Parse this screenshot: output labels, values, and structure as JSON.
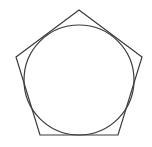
{
  "diagram": {
    "stroke_color": "#3a3a3a",
    "background": "#ffffff",
    "pentagon": {
      "points": [
        [
          79,
          10
        ],
        [
          142,
          57
        ],
        [
          118,
          135
        ],
        [
          40,
          135
        ],
        [
          16,
          57
        ]
      ]
    },
    "circle": {
      "cx": 79,
      "cy": 80,
      "r": 55
    }
  }
}
